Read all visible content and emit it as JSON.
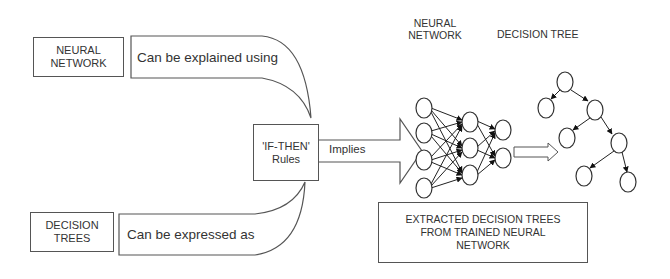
{
  "diagram": {
    "neural_network_box": {
      "line1": "NEURAL",
      "line2": "NETWORK"
    },
    "explained_callout": {
      "text": "Can be explained using"
    },
    "decision_trees_box": {
      "line1": "DECISION",
      "line2": "TREES"
    },
    "expressed_callout": {
      "text": "Can be expressed as"
    },
    "rules_box": {
      "line1": "'IF-THEN'",
      "line2": "Rules"
    },
    "implies_arrow": {
      "text": "Implies"
    },
    "nn_heading": {
      "line1": "NEURAL",
      "line2": "NETWORK"
    },
    "dt_heading": {
      "text": "DECISION TREE"
    },
    "extracted_box": {
      "line1": "EXTRACTED DECISION TREES",
      "line2": "FROM TRAINED NEURAL",
      "line3": "NETWORK"
    },
    "neural_net": {
      "layers": [
        [
          [
            424,
            108
          ],
          [
            424,
            133
          ],
          [
            424,
            160
          ],
          [
            424,
            188
          ]
        ],
        [
          [
            470,
            122
          ],
          [
            470,
            148
          ],
          [
            470,
            175
          ]
        ],
        [
          [
            503,
            130
          ],
          [
            503,
            158
          ]
        ]
      ]
    },
    "tree": {
      "nodes": [
        [
          565,
          82
        ],
        [
          546,
          108
        ],
        [
          595,
          110
        ],
        [
          567,
          138
        ],
        [
          619,
          143
        ],
        [
          584,
          176
        ],
        [
          628,
          182
        ]
      ],
      "edges": [
        [
          0,
          1
        ],
        [
          0,
          2
        ],
        [
          2,
          3
        ],
        [
          2,
          4
        ],
        [
          4,
          5
        ],
        [
          4,
          6
        ]
      ]
    },
    "colors": {
      "stroke": "#444444",
      "text": "#333333",
      "background": "#ffffff"
    }
  }
}
